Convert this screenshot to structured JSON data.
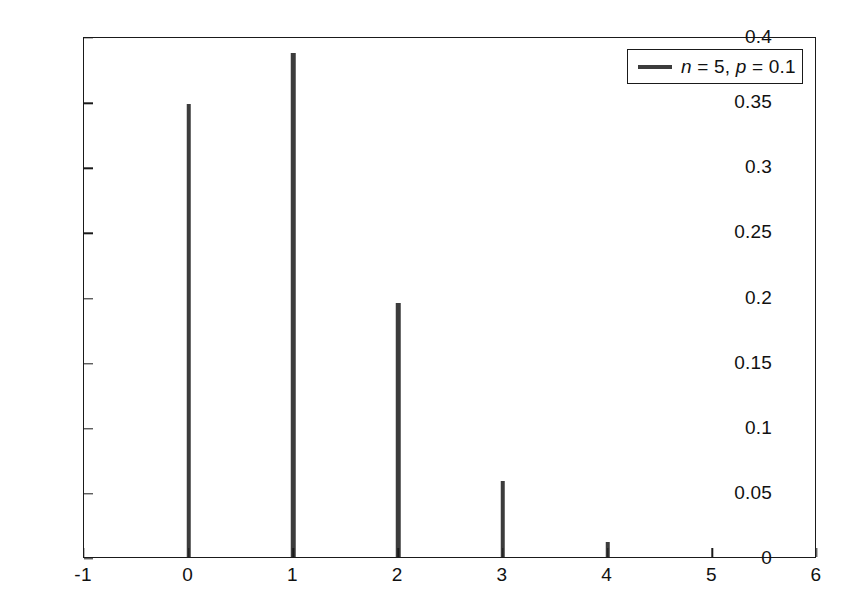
{
  "chart_data": {
    "type": "bar",
    "title": "",
    "subtitle": "",
    "xlabel": "",
    "ylabel": "",
    "xlim": [
      -1,
      6
    ],
    "ylim": [
      0,
      0.4
    ],
    "grid": false,
    "legend_position": "top-right",
    "categories": [
      0,
      1,
      2,
      3,
      4,
      5
    ],
    "values": [
      0.3477,
      0.3872,
      0.1948,
      0.0586,
      0.0115,
      0.0
    ],
    "series": [
      {
        "name": "n = 5, p = 0.1",
        "values": [
          0.3477,
          0.3872,
          0.1948,
          0.0586,
          0.0115,
          0.0
        ]
      }
    ],
    "xticks": [
      -1,
      0,
      1,
      2,
      3,
      4,
      5,
      6
    ],
    "xticklabels": [
      "-1",
      "0",
      "1",
      "2",
      "3",
      "4",
      "5",
      "6"
    ],
    "yticks": [
      0,
      0.05,
      0.1,
      0.15,
      0.2,
      0.25,
      0.3,
      0.35,
      0.4
    ],
    "yticklabels": [
      "0",
      "0.05",
      "0.1",
      "0.15",
      "0.2",
      "0.25",
      "0.3",
      "0.35",
      "0.4"
    ],
    "bar_color": "#3c3c3c",
    "axes_color": "#1a1a1a",
    "background_color": "#ffffff"
  },
  "legend": {
    "entries": [
      {
        "label": "n = 5, p = 0.1",
        "label_parts": {
          "n_symbol": "n",
          "n_eq": " = 5, ",
          "p_symbol": "p",
          "p_eq": " = 0.1"
        },
        "color": "#3c3c3c"
      }
    ]
  }
}
